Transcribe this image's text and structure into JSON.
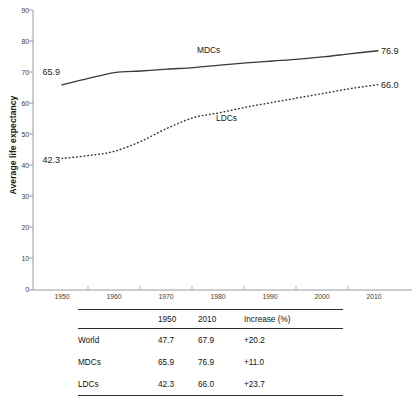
{
  "chart_data": {
    "type": "line",
    "title": "",
    "xlabel": "",
    "ylabel": "Average life expectancy",
    "xlim": [
      1945,
      2015
    ],
    "ylim": [
      0,
      90
    ],
    "yticks": [
      0,
      10,
      20,
      30,
      40,
      50,
      60,
      70,
      80,
      90
    ],
    "xticks": [
      1950,
      1960,
      1970,
      1980,
      1990,
      2000,
      2010
    ],
    "grid": false,
    "legend_position": "inline-annotations",
    "x": [
      1950,
      1955,
      1960,
      1965,
      1970,
      1975,
      1980,
      1985,
      1990,
      1995,
      2000,
      2005,
      2010
    ],
    "series": [
      {
        "name": "MDCs",
        "style": "solid",
        "color": "#3a3a3a",
        "values": [
          65.9,
          68.0,
          69.9,
          70.4,
          71.0,
          71.5,
          72.3,
          73.0,
          73.6,
          74.2,
          75.0,
          76.0,
          76.9
        ],
        "start_label": "65.9",
        "end_label": "76.9",
        "annotation": "MDCs"
      },
      {
        "name": "LDCs",
        "style": "dotted",
        "color": "#3a3a3a",
        "values": [
          42.3,
          43.2,
          44.6,
          47.8,
          52.0,
          55.4,
          57.0,
          58.8,
          60.3,
          61.8,
          63.3,
          64.8,
          66.0
        ],
        "start_label": "42.3",
        "end_label": "66.0",
        "annotation": "LDCs"
      }
    ]
  },
  "table": {
    "columns": [
      "",
      "1950",
      "2010",
      "Increase (%)"
    ],
    "rows": [
      {
        "name": "World",
        "y1950": "47.7",
        "y2010": "67.9",
        "increase": "+20.2"
      },
      {
        "name": "MDCs",
        "y1950": "65.9",
        "y2010": "76.9",
        "increase": "+11.0"
      },
      {
        "name": "LDCs",
        "y1950": "42.3",
        "y2010": "66.0",
        "increase": "+23.7"
      }
    ]
  }
}
